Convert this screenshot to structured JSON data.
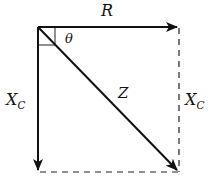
{
  "diagram": {
    "type": "impedance-phasor-diagram",
    "labels": {
      "resistance": "R",
      "angle": "θ",
      "impedance": "Z",
      "reactance_left_main": "X",
      "reactance_left_sub": "C",
      "reactance_right_main": "X",
      "reactance_right_sub": "C"
    },
    "vectors": [
      {
        "name": "R",
        "from": [
          38,
          27
        ],
        "to": [
          177,
          27
        ],
        "style": "solid-arrow"
      },
      {
        "name": "X_C",
        "from": [
          38,
          27
        ],
        "to": [
          38,
          170
        ],
        "style": "solid-arrow"
      },
      {
        "name": "Z",
        "from": [
          38,
          27
        ],
        "to": [
          177,
          170
        ],
        "style": "solid-arrow"
      }
    ],
    "construction_lines": [
      {
        "from": [
          179,
          27
        ],
        "to": [
          179,
          172
        ],
        "style": "dashed"
      },
      {
        "from": [
          38,
          172
        ],
        "to": [
          179,
          172
        ],
        "style": "dashed"
      }
    ],
    "right_angle_marker": true,
    "colors": {
      "line": "#111111",
      "background": "#ffffff"
    }
  }
}
